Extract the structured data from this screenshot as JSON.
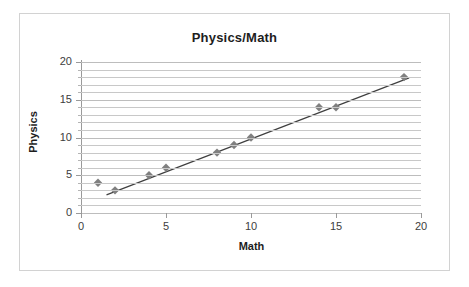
{
  "chart_data": {
    "type": "scatter",
    "title": "Physics/Math",
    "xlabel": "Math",
    "ylabel": "Physics",
    "xlim": [
      0,
      20
    ],
    "ylim": [
      0,
      20
    ],
    "x_ticks": [
      0,
      5,
      10,
      15,
      20
    ],
    "y_ticks": [
      0,
      5,
      10,
      15,
      20
    ],
    "x_tick_labels": [
      "0",
      "5",
      "10",
      "15",
      "20"
    ],
    "y_tick_labels": [
      "0",
      "5",
      "10",
      "15",
      "20"
    ],
    "minor_gridlines": true,
    "minor_grid_step": 1,
    "grid": "horizontal",
    "legend": "none",
    "marker": "diamond",
    "marker_color": "#808080",
    "trendline": {
      "present": true,
      "color": "#3f3f3f",
      "x_start": 1.5,
      "x_end": 19.3,
      "y_start": 2.4,
      "y_end": 17.9
    },
    "x": [
      1,
      2,
      4,
      5,
      8,
      9,
      10,
      14,
      15,
      19
    ],
    "y": [
      4,
      3,
      5,
      6,
      8,
      9,
      10,
      14,
      14,
      18
    ],
    "points": [
      {
        "x": 1,
        "y": 4
      },
      {
        "x": 2,
        "y": 3
      },
      {
        "x": 4,
        "y": 5
      },
      {
        "x": 5,
        "y": 6
      },
      {
        "x": 8,
        "y": 8
      },
      {
        "x": 9,
        "y": 9
      },
      {
        "x": 10,
        "y": 10
      },
      {
        "x": 14,
        "y": 14
      },
      {
        "x": 15,
        "y": 14
      },
      {
        "x": 19,
        "y": 18
      }
    ]
  },
  "colors": {
    "marker": "#808080",
    "trendline": "#3f3f3f",
    "gridline": "#c8c8c8",
    "axis": "#9a9a9a",
    "text": "#1d1d1d",
    "frame_border": "#d2d2d2",
    "background": "#ffffff"
  }
}
